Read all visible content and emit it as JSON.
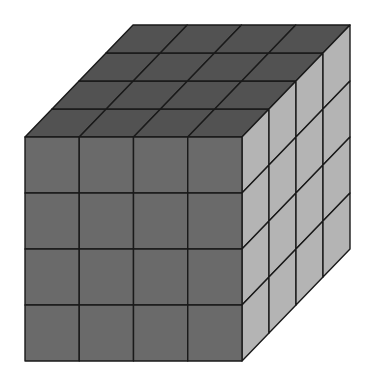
{
  "figure": {
    "grid": {
      "rows": 4,
      "cols": 4,
      "depth": 4
    },
    "geometry": {
      "front": {
        "x0": 25,
        "y0": 137,
        "x1": 242,
        "y1": 361
      },
      "depth_offset": {
        "dx": 108,
        "dy": -112
      }
    },
    "colors": {
      "front_face": "#6a6a6a",
      "top_face": "#525252",
      "side_face": "#b4b4b4",
      "grid_line": "#1a1a1a",
      "background": "#ffffff"
    }
  }
}
